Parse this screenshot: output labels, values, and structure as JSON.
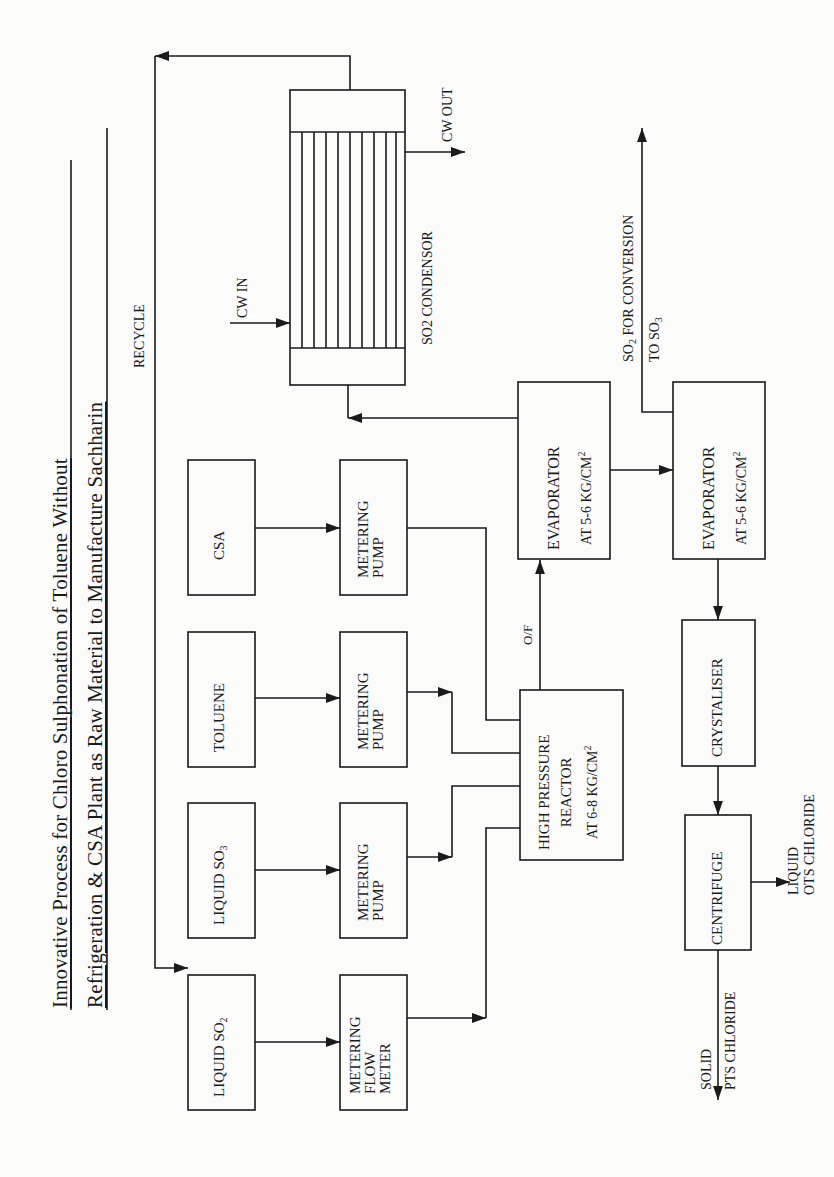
{
  "title": {
    "line1": "Innovative  Process  for  Chloro  Sulphonation  of  Toluene  Without",
    "line2": "Refrigeration & CSA Plant as Raw Material to Manufacture  Sachharin"
  },
  "labels": {
    "recycle": "RECYCLE",
    "cw_in": "CW  IN",
    "cw_out": "CW  OUT",
    "condenser": "SO2 CONDENSOR",
    "overflow": "O/F",
    "so2_conv_line1_prefix": "SO",
    "so2_conv_line1_sub": "2",
    "so2_conv_line1_rest": "  FOR CONVERSION",
    "so2_conv_line2_prefix": "TO  SO",
    "so2_conv_line2_sub": "3",
    "liquid_ots_line1": "LIQUID",
    "liquid_ots_line2": "OTS CHLORIDE",
    "solid_pts_line1": "SOLID",
    "solid_pts_line2": "PTS CHLORIDE"
  },
  "boxes": {
    "csa": "CSA",
    "toluene": "TOLUENE",
    "liquid_so3_prefix": "LIQUID SO",
    "liquid_so3_sub": "3",
    "liquid_so2_prefix": "LIQUID SO",
    "liquid_so2_sub": "2",
    "pump_csa": [
      "METERING",
      "PUMP"
    ],
    "pump_toluene": [
      "METERING",
      "PUMP"
    ],
    "pump_so3": [
      "METERING",
      "PUMP"
    ],
    "flow_meter": [
      "METERING",
      "FLOW",
      "METER"
    ],
    "reactor": [
      "HIGH PRESSURE",
      "REACTOR",
      "AT 6-8 KG/CM"
    ],
    "reactor_sup": "2",
    "evaporator1": [
      "EVAPORATOR",
      "AT 5-6 KG/CM"
    ],
    "evaporator1_sup": "2",
    "evaporator2": [
      "EVAPORATOR",
      "AT 5-6 KG/CM"
    ],
    "evaporator2_sup": "2",
    "crystaliser": "CRYSTALISER",
    "centrifuge": "CENTRIFUGE"
  },
  "colors": {
    "line": "#1a1a1a",
    "background": "#fbfbfa"
  }
}
